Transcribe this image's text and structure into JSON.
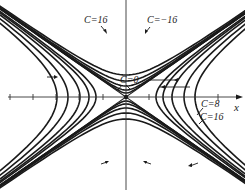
{
  "figure": {
    "title": ""
  },
  "axes": {
    "x_label": "x",
    "origin_px": [
      126,
      97
    ],
    "tick_spacing_px": 23,
    "ticks_left_px": [
      10,
      33,
      56,
      79,
      103
    ],
    "ticks_right_px": [
      149,
      172,
      195,
      218
    ]
  },
  "labels": {
    "c16_top_left": "C=16",
    "c_neg16_top_right": "C=−16",
    "c0": "C=0",
    "c8": "C=8",
    "c16_right": "C=16"
  },
  "curves": {
    "horizontal_family_semi_axes_px": [
      30,
      37,
      46,
      58,
      69
    ],
    "vertical_family_semi_axes_px": [
      4,
      7,
      11,
      16,
      22
    ],
    "asymptote_slope": 0.7
  },
  "colors": {
    "ink": "#1a1a1a",
    "background": "#ffffff"
  }
}
